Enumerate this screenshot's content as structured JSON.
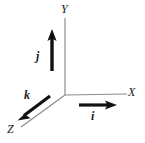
{
  "figure": {
    "background_color": "#ffffff",
    "axis_color": "#8c8c8c",
    "vector_color": "#111111",
    "label_color": "#1a1a1a"
  },
  "axes": {
    "origin": {
      "x": 65,
      "y": 95
    },
    "items": [
      {
        "name": "x-axis",
        "label": "X",
        "from": {
          "x": 65,
          "y": 95
        },
        "to": {
          "x": 127,
          "y": 94
        },
        "label_pos": {
          "x": 128,
          "y": 86
        }
      },
      {
        "name": "y-axis",
        "label": "Y",
        "from": {
          "x": 65,
          "y": 95
        },
        "to": {
          "x": 65,
          "y": 18
        },
        "label_pos": {
          "x": 61,
          "y": 3
        }
      },
      {
        "name": "z-axis",
        "label": "Z",
        "from": {
          "x": 65,
          "y": 95
        },
        "to": {
          "x": 21,
          "y": 127
        },
        "label_pos": {
          "x": 7,
          "y": 123
        }
      }
    ]
  },
  "vectors": [
    {
      "name": "i",
      "label": "i",
      "along": "x-axis",
      "from": {
        "x": 79,
        "y": 105
      },
      "to": {
        "x": 116,
        "y": 105
      },
      "label_pos": {
        "x": 91,
        "y": 110
      }
    },
    {
      "name": "j",
      "label": "j",
      "along": "y-axis",
      "from": {
        "x": 52,
        "y": 71
      },
      "to": {
        "x": 52,
        "y": 30
      },
      "label_pos": {
        "x": 36,
        "y": 50
      }
    },
    {
      "name": "k",
      "label": "k",
      "along": "z-axis",
      "from": {
        "x": 50,
        "y": 96
      },
      "to": {
        "x": 18,
        "y": 120
      },
      "label_pos": {
        "x": 24,
        "y": 89
      }
    }
  ]
}
